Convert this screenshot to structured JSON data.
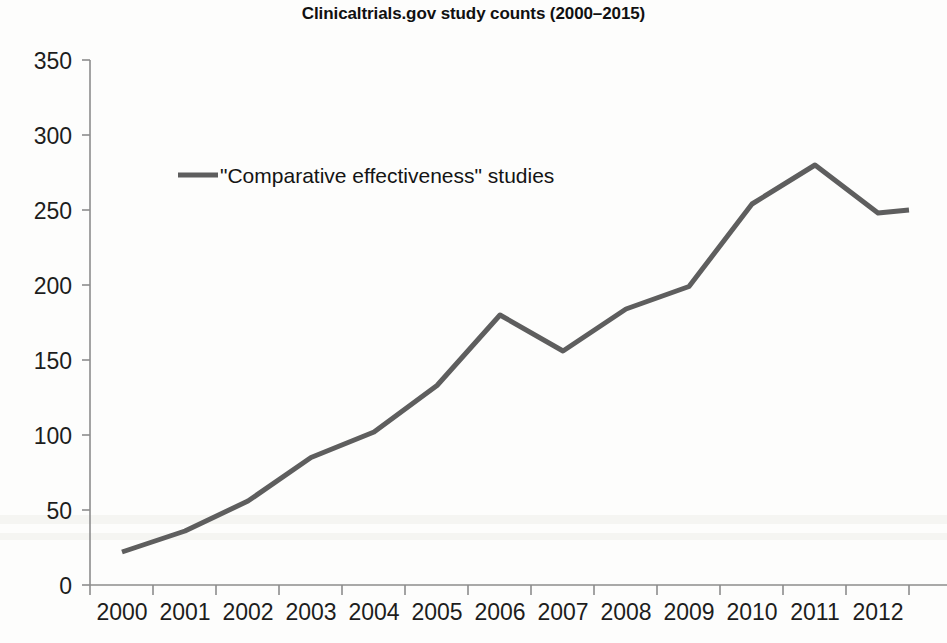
{
  "chart_data": {
    "type": "line",
    "title": "Clinicaltrials.gov study counts (2000–2015)",
    "xlabel": "",
    "ylabel": "",
    "categories": [
      "2000",
      "2001",
      "2002",
      "2003",
      "2004",
      "2005",
      "2006",
      "2007",
      "2008",
      "2009",
      "2010",
      "2011",
      "2012"
    ],
    "x": [
      2000,
      2001,
      2002,
      2003,
      2004,
      2005,
      2006,
      2007,
      2008,
      2009,
      2010,
      2011,
      2012
    ],
    "series": [
      {
        "name": "\"Comparative effectiveness\" studies",
        "color": "#5e5e5e",
        "values": [
          22,
          36,
          56,
          85,
          102,
          133,
          180,
          156,
          184,
          199,
          254,
          280,
          248
        ]
      }
    ],
    "trailing_segment_note": "line continues flat to ~250 at the right edge of the visible plot area (next year partially cropped)",
    "trailing_value": 250,
    "ylim": [
      0,
      350
    ],
    "yticks": [
      0,
      50,
      100,
      150,
      200,
      250,
      300,
      350
    ],
    "ytick_labels": [
      "0",
      "50",
      "100",
      "150",
      "200",
      "250",
      "300",
      "350"
    ],
    "xtick_labels": [
      "2000",
      "2001",
      "2002",
      "2003",
      "2004",
      "2005",
      "2006",
      "2007",
      "2008",
      "2009",
      "2010",
      "2011",
      "2012"
    ],
    "grid": false,
    "legend_position": "upper-left-inside",
    "legend_entries": [
      "\"Comparative effectiveness\" studies"
    ],
    "line_width_px": 5,
    "axis_color": "#8c8c8c",
    "background_color": "#fdfdfc"
  },
  "figure": {
    "title": "Clinicaltrials.gov study counts (2000–2015)",
    "legend": {
      "swatch_name": "legend-line-swatch",
      "label": "\"Comparative effectiveness\" studies"
    },
    "y_axis": {
      "labels": [
        "350",
        "300",
        "250",
        "200",
        "150",
        "100",
        "50",
        "0"
      ]
    },
    "x_axis": {
      "labels": [
        "2000",
        "2001",
        "2002",
        "2003",
        "2004",
        "2005",
        "2006",
        "2007",
        "2008",
        "2009",
        "2010",
        "2011",
        "2012"
      ]
    }
  }
}
